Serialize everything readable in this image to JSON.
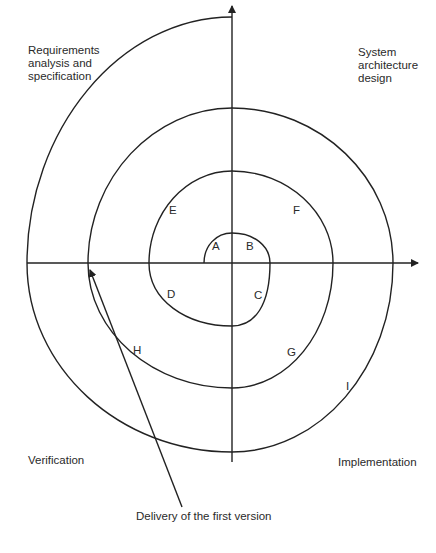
{
  "diagram": {
    "type": "spiral-model",
    "quadrants": {
      "top_left": "Requirements\nanalysis and\nspecification",
      "top_right": "System\narchitecture\ndesign",
      "bottom_left": "Verification",
      "bottom_right": "Implementation"
    },
    "points": {
      "A": "A",
      "B": "B",
      "C": "C",
      "D": "D",
      "E": "E",
      "F": "F",
      "G": "G",
      "H": "H",
      "I": "I"
    },
    "annotation": "Delivery of the first version",
    "colors": {
      "line": "#222222",
      "background": "#ffffff"
    }
  }
}
